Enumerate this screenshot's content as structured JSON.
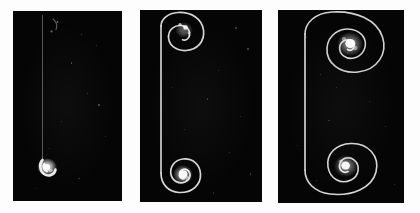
{
  "figure": {
    "kind": "scientific-figure",
    "background_color": "#fdfdfd",
    "panel_background_color": "#050505",
    "filament_color": "#e8e8e8",
    "core_color": "#ffffff",
    "panel_count": 3
  },
  "panels": [
    {
      "id": "panel-1",
      "label": "",
      "x": 13,
      "y": 11,
      "width": 109,
      "height": 190,
      "stage": "early",
      "filament_x": 0.27,
      "features": [
        {
          "name": "straight-filament",
          "type": "line"
        },
        {
          "name": "incipient-vortex-core",
          "type": "blob",
          "cx": 0.3,
          "cy": 0.8
        },
        {
          "name": "faint-upper-wisp",
          "type": "wisp",
          "cx": 0.42,
          "cy": 0.1
        }
      ]
    },
    {
      "id": "panel-2",
      "label": "",
      "x": 140,
      "y": 10,
      "width": 122,
      "height": 192,
      "stage": "intermediate",
      "filament_x": 0.17,
      "features": [
        {
          "name": "upper-vortex-rollup",
          "type": "spiral",
          "cx": 0.4,
          "cy": 0.1,
          "turns": 1.2
        },
        {
          "name": "lower-vortex-rollup",
          "type": "spiral",
          "cx": 0.35,
          "cy": 0.85,
          "turns": 1.8
        },
        {
          "name": "connecting-filament",
          "type": "line"
        }
      ]
    },
    {
      "id": "panel-3",
      "label": "",
      "x": 278,
      "y": 10,
      "width": 126,
      "height": 193,
      "stage": "late",
      "filament_x": 0.21,
      "features": [
        {
          "name": "upper-vortex-spiral",
          "type": "spiral",
          "cx": 0.76,
          "cy": 0.15,
          "turns": 2.6
        },
        {
          "name": "lower-vortex-spiral",
          "type": "spiral",
          "cx": 0.7,
          "cy": 0.86,
          "turns": 2.4
        },
        {
          "name": "connecting-filament",
          "type": "line"
        }
      ]
    }
  ],
  "gaps": [
    {
      "name": "gap-1-2",
      "x": 122,
      "y": 0,
      "width": 18,
      "height": 213
    },
    {
      "name": "gap-2-3",
      "x": 262,
      "y": 0,
      "width": 16,
      "height": 213
    }
  ]
}
